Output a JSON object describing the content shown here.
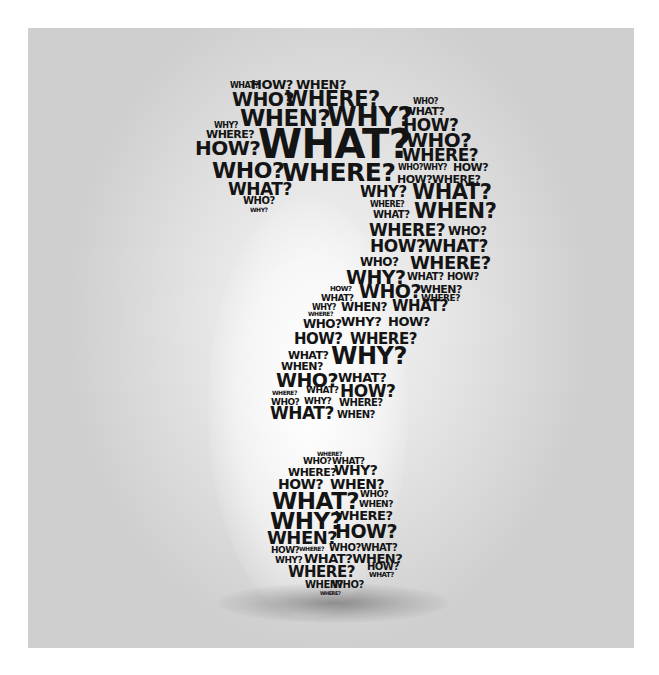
{
  "image": {
    "subject": "Question mark composed of question words",
    "background_color": "#d9d9d9",
    "text_color": "#141414"
  },
  "words": [
    {
      "t": "WHAT?",
      "x": 230,
      "y": 82,
      "s": 8
    },
    {
      "t": "HOW?",
      "x": 251,
      "y": 78,
      "s": 13
    },
    {
      "t": "WHEN?",
      "x": 296,
      "y": 78,
      "s": 13
    },
    {
      "t": "WHO?",
      "x": 232,
      "y": 90,
      "s": 19
    },
    {
      "t": "WHERE?",
      "x": 285,
      "y": 89,
      "s": 21
    },
    {
      "t": "WHO?",
      "x": 413,
      "y": 98,
      "s": 8
    },
    {
      "t": "WHEN?",
      "x": 240,
      "y": 107,
      "s": 23
    },
    {
      "t": "WHY?",
      "x": 327,
      "y": 103,
      "s": 27
    },
    {
      "t": "WHAT?",
      "x": 404,
      "y": 106,
      "s": 11
    },
    {
      "t": "HOW?",
      "x": 403,
      "y": 117,
      "s": 17
    },
    {
      "t": "WHY?",
      "x": 214,
      "y": 122,
      "s": 8
    },
    {
      "t": "WHERE?",
      "x": 206,
      "y": 129,
      "s": 11
    },
    {
      "t": "HOW?",
      "x": 195,
      "y": 138,
      "s": 20
    },
    {
      "t": "WHAT?",
      "x": 258,
      "y": 124,
      "s": 40
    },
    {
      "t": "WHO?",
      "x": 406,
      "y": 130,
      "s": 20
    },
    {
      "t": "WHERE?",
      "x": 402,
      "y": 147,
      "s": 17
    },
    {
      "t": "WHO?",
      "x": 212,
      "y": 160,
      "s": 22
    },
    {
      "t": "WHERE?",
      "x": 282,
      "y": 160,
      "s": 25
    },
    {
      "t": "WHO?WHY?",
      "x": 398,
      "y": 164,
      "s": 8
    },
    {
      "t": "HOW?",
      "x": 453,
      "y": 162,
      "s": 11
    },
    {
      "t": "HOW?WHERE?",
      "x": 397,
      "y": 174,
      "s": 11
    },
    {
      "t": "WHAT?",
      "x": 228,
      "y": 181,
      "s": 17
    },
    {
      "t": "WHO?",
      "x": 243,
      "y": 196,
      "s": 10
    },
    {
      "t": "WHY?",
      "x": 250,
      "y": 207,
      "s": 6
    },
    {
      "t": "WHY?",
      "x": 360,
      "y": 185,
      "s": 15
    },
    {
      "t": "WHAT?",
      "x": 412,
      "y": 182,
      "s": 21
    },
    {
      "t": "WHERE?",
      "x": 370,
      "y": 201,
      "s": 8
    },
    {
      "t": "WHAT?",
      "x": 373,
      "y": 210,
      "s": 10
    },
    {
      "t": "WHEN?",
      "x": 414,
      "y": 201,
      "s": 21
    },
    {
      "t": "WHERE?",
      "x": 369,
      "y": 222,
      "s": 17
    },
    {
      "t": "WHO?",
      "x": 448,
      "y": 225,
      "s": 12
    },
    {
      "t": "HOW?",
      "x": 370,
      "y": 238,
      "s": 17
    },
    {
      "t": "WHAT?",
      "x": 424,
      "y": 238,
      "s": 17
    },
    {
      "t": "WHO?",
      "x": 360,
      "y": 256,
      "s": 12
    },
    {
      "t": "WHERE?",
      "x": 410,
      "y": 254,
      "s": 18
    },
    {
      "t": "WHY?",
      "x": 346,
      "y": 268,
      "s": 19
    },
    {
      "t": "WHAT?",
      "x": 407,
      "y": 272,
      "s": 10
    },
    {
      "t": "HOW?",
      "x": 447,
      "y": 272,
      "s": 10
    },
    {
      "t": "HOW?",
      "x": 330,
      "y": 286,
      "s": 7
    },
    {
      "t": "WHAT?",
      "x": 321,
      "y": 294,
      "s": 9
    },
    {
      "t": "WHO?",
      "x": 359,
      "y": 282,
      "s": 19
    },
    {
      "t": "WHEN?",
      "x": 420,
      "y": 284,
      "s": 11
    },
    {
      "t": "WHERE?",
      "x": 421,
      "y": 294,
      "s": 9
    },
    {
      "t": "WHY?",
      "x": 312,
      "y": 304,
      "s": 8
    },
    {
      "t": "WHEN?",
      "x": 341,
      "y": 301,
      "s": 12
    },
    {
      "t": "WHAT?",
      "x": 392,
      "y": 299,
      "s": 15
    },
    {
      "t": "WHERE?",
      "x": 308,
      "y": 311,
      "s": 6
    },
    {
      "t": "WHO?",
      "x": 303,
      "y": 318,
      "s": 12
    },
    {
      "t": "WHY?",
      "x": 341,
      "y": 315,
      "s": 13
    },
    {
      "t": "HOW?",
      "x": 388,
      "y": 315,
      "s": 13
    },
    {
      "t": "HOW?",
      "x": 294,
      "y": 332,
      "s": 15
    },
    {
      "t": "WHERE?",
      "x": 350,
      "y": 332,
      "s": 15
    },
    {
      "t": "WHAT?",
      "x": 288,
      "y": 350,
      "s": 11
    },
    {
      "t": "WHEN?",
      "x": 281,
      "y": 361,
      "s": 11
    },
    {
      "t": "WHY?",
      "x": 331,
      "y": 344,
      "s": 24
    },
    {
      "t": "WHO?",
      "x": 276,
      "y": 371,
      "s": 19
    },
    {
      "t": "WHAT?",
      "x": 338,
      "y": 371,
      "s": 13
    },
    {
      "t": "WHERE?",
      "x": 272,
      "y": 390,
      "s": 6
    },
    {
      "t": "WHAT?",
      "x": 306,
      "y": 386,
      "s": 9
    },
    {
      "t": "HOW?",
      "x": 340,
      "y": 383,
      "s": 17
    },
    {
      "t": "WHO?",
      "x": 271,
      "y": 398,
      "s": 9
    },
    {
      "t": "WHY?",
      "x": 304,
      "y": 397,
      "s": 9
    },
    {
      "t": "WHERE?",
      "x": 339,
      "y": 398,
      "s": 10
    },
    {
      "t": "WHAT?",
      "x": 270,
      "y": 405,
      "s": 17
    },
    {
      "t": "WHEN?",
      "x": 337,
      "y": 410,
      "s": 10
    },
    {
      "t": "WHERE?",
      "x": 317,
      "y": 451,
      "s": 6
    },
    {
      "t": "WHO?",
      "x": 303,
      "y": 457,
      "s": 9
    },
    {
      "t": "WHAT?",
      "x": 332,
      "y": 457,
      "s": 9
    },
    {
      "t": "WHERE?",
      "x": 288,
      "y": 467,
      "s": 11
    },
    {
      "t": "WHY?",
      "x": 334,
      "y": 463,
      "s": 14
    },
    {
      "t": "HOW?",
      "x": 278,
      "y": 477,
      "s": 14
    },
    {
      "t": "WHEN?",
      "x": 330,
      "y": 477,
      "s": 14
    },
    {
      "t": "WHAT?",
      "x": 272,
      "y": 490,
      "s": 23
    },
    {
      "t": "WHO?",
      "x": 360,
      "y": 490,
      "s": 9
    },
    {
      "t": "WHEN?",
      "x": 359,
      "y": 500,
      "s": 9
    },
    {
      "t": "WHY?",
      "x": 270,
      "y": 510,
      "s": 23
    },
    {
      "t": "WHERE?",
      "x": 335,
      "y": 509,
      "s": 13
    },
    {
      "t": "WHEN?",
      "x": 267,
      "y": 529,
      "s": 18
    },
    {
      "t": "HOW?",
      "x": 335,
      "y": 522,
      "s": 19
    },
    {
      "t": "HOW?",
      "x": 271,
      "y": 546,
      "s": 9
    },
    {
      "t": "WHERE?",
      "x": 299,
      "y": 546,
      "s": 6
    },
    {
      "t": "WHO?WHAT?",
      "x": 329,
      "y": 543,
      "s": 10
    },
    {
      "t": "WHY?",
      "x": 275,
      "y": 556,
      "s": 9
    },
    {
      "t": "WHAT?WHEN?",
      "x": 304,
      "y": 552,
      "s": 13
    },
    {
      "t": "WHERE?",
      "x": 288,
      "y": 565,
      "s": 15
    },
    {
      "t": "HOW?",
      "x": 367,
      "y": 562,
      "s": 10
    },
    {
      "t": "WHAT?",
      "x": 369,
      "y": 572,
      "s": 7
    },
    {
      "t": "WHEN?",
      "x": 305,
      "y": 580,
      "s": 10
    },
    {
      "t": "WHO?",
      "x": 332,
      "y": 580,
      "s": 10
    },
    {
      "t": "WHERE?",
      "x": 320,
      "y": 591,
      "s": 5
    }
  ]
}
